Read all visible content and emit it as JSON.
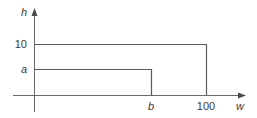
{
  "diagram": {
    "type": "axes-with-rectangles",
    "axes": {
      "y_label": "h",
      "x_label": "w"
    },
    "y_ticks": [
      {
        "label": "10",
        "italic": false
      },
      {
        "label": "a",
        "italic": true
      }
    ],
    "x_ticks": [
      {
        "label": "b",
        "italic": true
      },
      {
        "label": "100",
        "italic": false
      }
    ],
    "rectangles": [
      {
        "name": "outer",
        "width_label": "100",
        "height_label": "10"
      },
      {
        "name": "inner",
        "width_label": "b",
        "height_label": "a"
      }
    ],
    "colors": {
      "line": "#5a5a5a",
      "axis": "#6a6a6a",
      "text": "#3a3a3a",
      "background": "#ffffff"
    }
  }
}
